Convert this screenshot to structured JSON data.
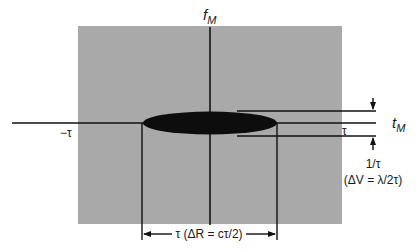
{
  "diagram": {
    "colors": {
      "background": "#ffffff",
      "region": "#a9a9a9",
      "ink": "#111111"
    },
    "axes": {
      "vertical_label": "f",
      "vertical_label_sub": "M",
      "horizontal_label": "t",
      "horizontal_label_sub": "M"
    },
    "labels": {
      "neg_tau": "−τ",
      "pos_tau": "τ",
      "doppler_width": "1/τ",
      "doppler_equation": "(ΔV = λ/2τ)",
      "range_width": "τ (ΔR = cτ/2)"
    }
  }
}
